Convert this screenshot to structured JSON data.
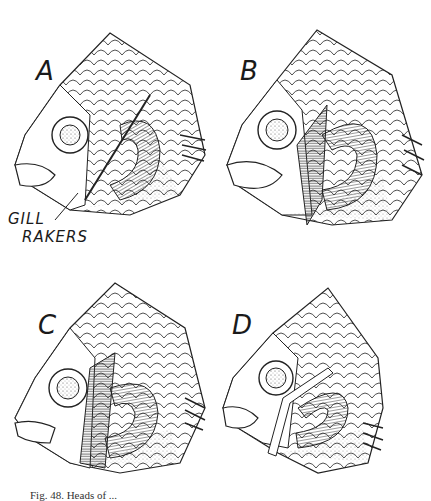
{
  "figure": {
    "panels": [
      {
        "letter": "A",
        "description": "fish-head-gill-cover-removed"
      },
      {
        "letter": "B",
        "description": "fish-head-gill-cover-removed"
      },
      {
        "letter": "C",
        "description": "fish-head-gill-cover-removed"
      },
      {
        "letter": "D",
        "description": "fish-head-gill-cover-removed"
      }
    ],
    "annotation": {
      "line1": "GILL",
      "line2": "RAKERS"
    },
    "caption": "Fig. 48. Heads of ..."
  },
  "colors": {
    "ink": "#1a1a1a",
    "background": "#ffffff"
  }
}
